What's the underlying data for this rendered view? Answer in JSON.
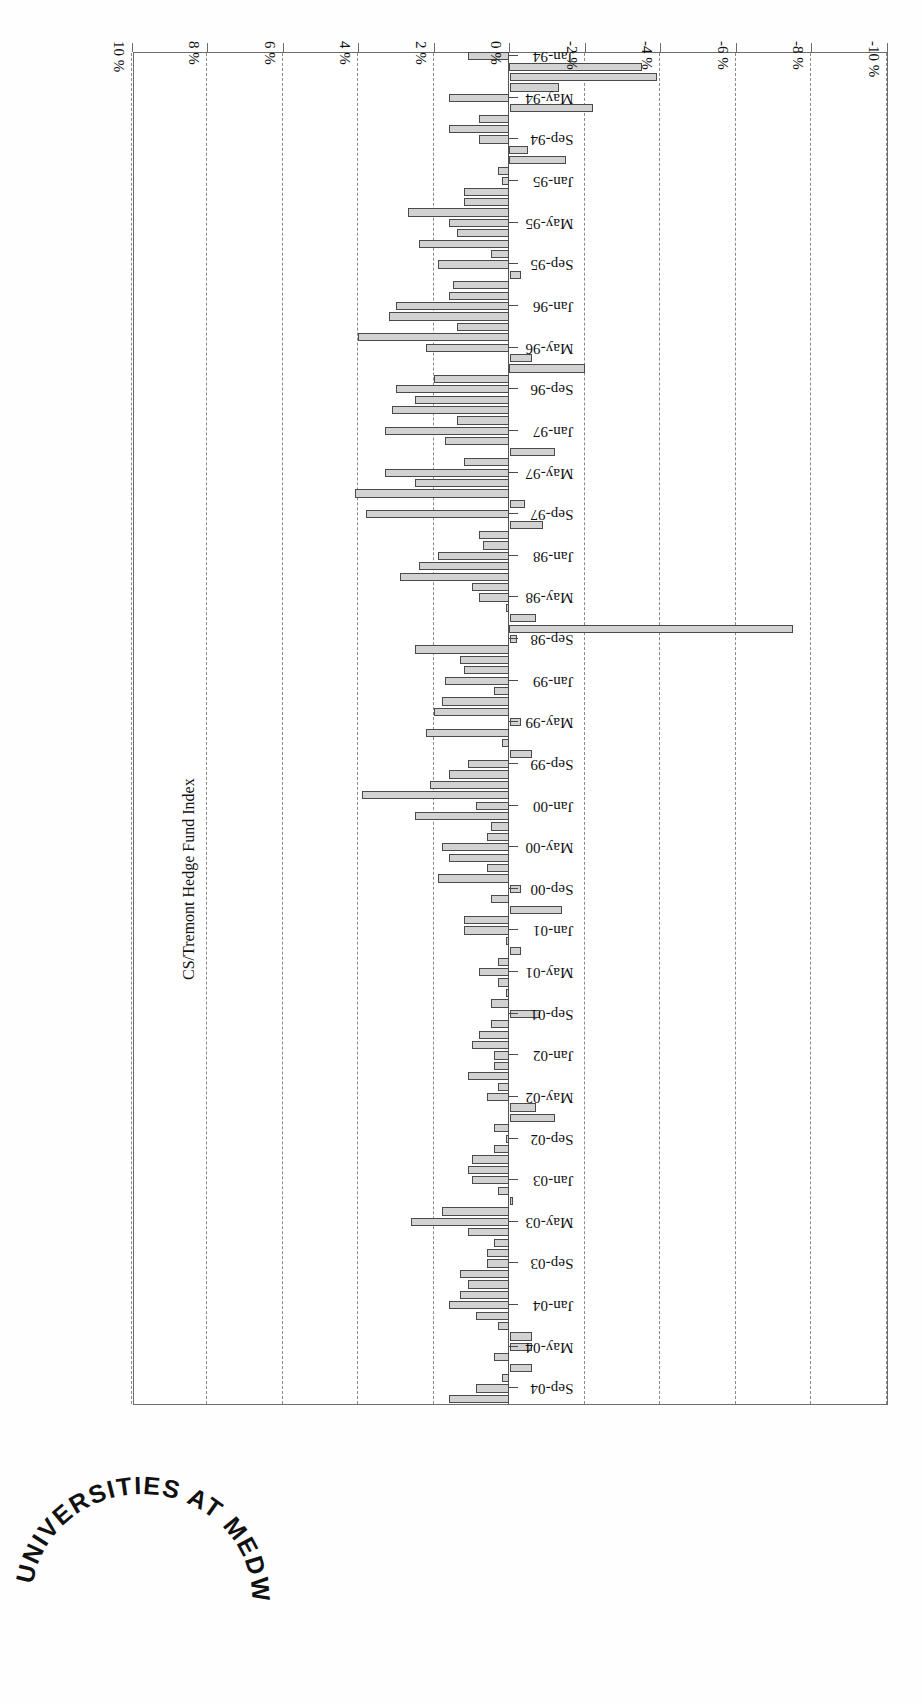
{
  "page": {
    "background_color": "#ffffff",
    "rotation_degrees": 180
  },
  "stamp": {
    "name": "library-stamp",
    "text": "UNIVERSITIES AT MEDWAY LIBRARY",
    "color": "#111111"
  },
  "chart_data": {
    "type": "bar",
    "orientation": "horizontal",
    "title": "CS/Tremont Hedge Fund Index",
    "xlabel": "",
    "ylabel": "",
    "xlim": [
      -10,
      10
    ],
    "x_tick_labels": [
      "10 %",
      "8 %",
      "6 %",
      "4 %",
      "2 %",
      "0 %",
      "-2 %",
      "-4 %",
      "-6 %",
      "-8 %",
      "-10 %"
    ],
    "x_tick_values": [
      10,
      8,
      6,
      4,
      2,
      0,
      -2,
      -4,
      -6,
      -8,
      -10
    ],
    "grid": true,
    "grid_style": "dashed",
    "legend": "none",
    "bar_fill_color": "#d2d2d2",
    "bar_edge_color": "#4a4a4a",
    "category_tick_labels": [
      "Jan-94",
      "May-94",
      "Sep-94",
      "Jan-95",
      "May-95",
      "Sep-95",
      "Jan-96",
      "May-96",
      "Sep-96",
      "Jan-97",
      "May-97",
      "Sep-97",
      "Jan-98",
      "May-98",
      "Sep-98",
      "Jan-99",
      "May-99",
      "Sep-99",
      "Jan-00",
      "May-00",
      "Sep-00",
      "Jan-01",
      "May-01",
      "Sep-01",
      "Jan-02",
      "May-02",
      "Sep-02",
      "Jan-03",
      "May-03",
      "Sep-03",
      "Jan-04",
      "May-04",
      "Sep-04"
    ],
    "categories": [
      "Jan-94",
      "Feb-94",
      "Mar-94",
      "Apr-94",
      "May-94",
      "Jun-94",
      "Jul-94",
      "Aug-94",
      "Sep-94",
      "Oct-94",
      "Nov-94",
      "Dec-94",
      "Jan-95",
      "Feb-95",
      "Mar-95",
      "Apr-95",
      "May-95",
      "Jun-95",
      "Jul-95",
      "Aug-95",
      "Sep-95",
      "Oct-95",
      "Nov-95",
      "Dec-95",
      "Jan-96",
      "Feb-96",
      "Mar-96",
      "Apr-96",
      "May-96",
      "Jun-96",
      "Jul-96",
      "Aug-96",
      "Sep-96",
      "Oct-96",
      "Nov-96",
      "Dec-96",
      "Jan-97",
      "Feb-97",
      "Mar-97",
      "Apr-97",
      "May-97",
      "Jun-97",
      "Jul-97",
      "Aug-97",
      "Sep-97",
      "Oct-97",
      "Nov-97",
      "Dec-97",
      "Jan-98",
      "Feb-98",
      "Mar-98",
      "Apr-98",
      "May-98",
      "Jun-98",
      "Jul-98",
      "Aug-98",
      "Sep-98",
      "Oct-98",
      "Nov-98",
      "Dec-98",
      "Jan-99",
      "Feb-99",
      "Mar-99",
      "Apr-99",
      "May-99",
      "Jun-99",
      "Jul-99",
      "Aug-99",
      "Sep-99",
      "Oct-99",
      "Nov-99",
      "Dec-99",
      "Jan-00",
      "Feb-00",
      "Mar-00",
      "Apr-00",
      "May-00",
      "Jun-00",
      "Jul-00",
      "Aug-00",
      "Sep-00",
      "Oct-00",
      "Nov-00",
      "Dec-00",
      "Jan-01",
      "Feb-01",
      "Mar-01",
      "Apr-01",
      "May-01",
      "Jun-01",
      "Jul-01",
      "Aug-01",
      "Sep-01",
      "Oct-01",
      "Nov-01",
      "Dec-01",
      "Jan-02",
      "Feb-02",
      "Mar-02",
      "Apr-02",
      "May-02",
      "Jun-02",
      "Jul-02",
      "Aug-02",
      "Sep-02",
      "Oct-02",
      "Nov-02",
      "Dec-02",
      "Jan-03",
      "Feb-03",
      "Mar-03",
      "Apr-03",
      "May-03",
      "Jun-03",
      "Jul-03",
      "Aug-03",
      "Sep-03",
      "Oct-03",
      "Nov-03",
      "Dec-03",
      "Jan-04",
      "Feb-04",
      "Mar-04",
      "Apr-04",
      "May-04",
      "Jun-04",
      "Jul-04",
      "Aug-04",
      "Sep-04",
      "Oct-04"
    ],
    "values": [
      1.1,
      -3.5,
      -3.9,
      -1.3,
      1.6,
      -2.2,
      0.8,
      1.6,
      0.8,
      -0.5,
      -1.5,
      0.3,
      0.2,
      1.2,
      1.2,
      2.7,
      1.6,
      1.4,
      2.4,
      0.5,
      1.9,
      -0.3,
      1.5,
      1.6,
      3.0,
      3.2,
      1.4,
      4.0,
      2.2,
      -0.6,
      -2.0,
      2.0,
      3.0,
      2.5,
      3.1,
      1.4,
      3.3,
      1.7,
      -1.2,
      1.2,
      3.3,
      2.5,
      4.1,
      -0.4,
      3.8,
      -0.9,
      0.8,
      0.7,
      1.9,
      2.4,
      2.9,
      1.0,
      0.8,
      0.1,
      -0.7,
      -7.5,
      -0.2,
      2.5,
      1.3,
      1.2,
      1.7,
      0.4,
      1.8,
      2.0,
      -0.3,
      2.2,
      0.2,
      -0.6,
      1.1,
      1.6,
      2.1,
      3.9,
      0.9,
      2.5,
      0.5,
      0.6,
      1.8,
      1.6,
      0.6,
      1.9,
      -0.3,
      0.5,
      -1.4,
      1.2,
      1.2,
      0.1,
      -0.3,
      0.3,
      0.8,
      0.3,
      0.1,
      0.5,
      -0.8,
      0.5,
      0.8,
      1.0,
      0.4,
      0.4,
      1.1,
      0.3,
      0.6,
      -0.7,
      -1.2,
      0.4,
      0.1,
      0.4,
      1.0,
      1.1,
      1.0,
      0.3,
      -0.1,
      1.8,
      2.6,
      1.1,
      0.4,
      0.6,
      0.6,
      1.3,
      1.1,
      1.3,
      1.6,
      0.9,
      0.3,
      -0.6,
      -0.6,
      0.4,
      -0.6,
      0.2,
      0.9,
      1.6
    ]
  }
}
